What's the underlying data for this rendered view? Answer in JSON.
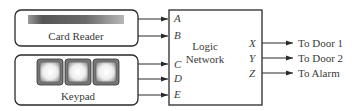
{
  "diagram": {
    "card_reader": {
      "label": "Card Reader"
    },
    "keypad": {
      "label": "Keypad",
      "key_count": 3
    },
    "logic_network": {
      "label_line1": "Logic",
      "label_line2": "Network",
      "inputs": [
        "A",
        "B",
        "C",
        "D",
        "E"
      ],
      "outputs": [
        "X",
        "Y",
        "Z"
      ]
    },
    "output_targets": [
      "To Door 1",
      "To Door 2",
      "To Alarm"
    ],
    "colors": {
      "line": "#2a2a2a",
      "text": "#3a3a3a"
    }
  }
}
